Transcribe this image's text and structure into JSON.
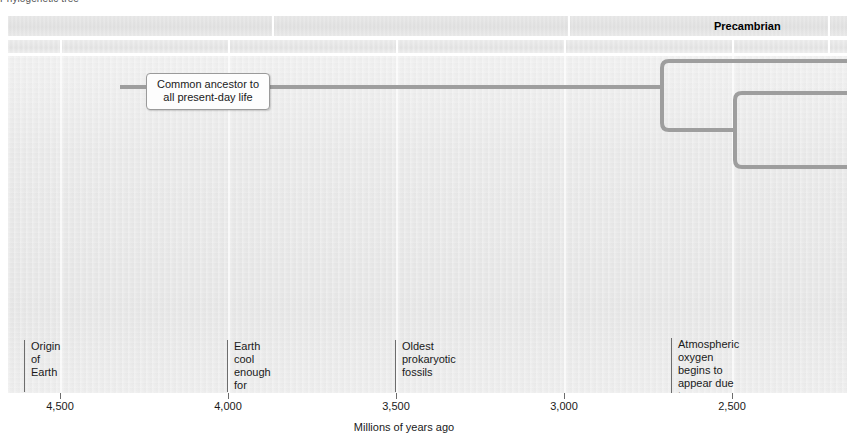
{
  "figure": {
    "caption": "Phylogenetic tree"
  },
  "colors": {
    "tree_line": "#9e9e9e",
    "band_fill": "#e0e0e0",
    "plot_bg": "#e9e9e9",
    "rule": "#6d6d6d",
    "text": "#1a1a1a"
  },
  "era_band": {
    "label": "Precambrian",
    "label_x": 706,
    "separators": [
      264,
      560,
      820
    ]
  },
  "period_band": {
    "separators": [
      52,
      220,
      388,
      556,
      724,
      820
    ]
  },
  "plot": {
    "column_separators": [
      52,
      220,
      388,
      556,
      724
    ]
  },
  "callout": {
    "line1": "Common ancestor to",
    "line2": "all present-day life"
  },
  "tree": {
    "trunk": {
      "x1": 112,
      "x2": 654,
      "y": 31
    },
    "node1": {
      "x": 654,
      "y_in": 31,
      "y_top": 5,
      "y_bottom": 74,
      "x_end": 839
    },
    "node2": {
      "x": 727,
      "y_in": 74,
      "y_top": 37,
      "y_bottom": 111,
      "x_end": 839
    }
  },
  "events": [
    {
      "name": "origin-of-earth",
      "x": 16,
      "y": 284,
      "rule_height": 52,
      "text": "Origin of\nEarth"
    },
    {
      "name": "crust-solidify",
      "x": 219,
      "y": 284,
      "rule_height": 52,
      "text": "Earth cool enough for\ncrust to solidify"
    },
    {
      "name": "oldest-prokaryotic-fossils",
      "x": 387,
      "y": 284,
      "rule_height": 52,
      "text": "Oldest prokaryotic fossils"
    },
    {
      "name": "atmospheric-oxygen",
      "x": 663,
      "y": 282,
      "rule_height": 56,
      "text": "Atmospheric oxygen\nbegins to appear due\nto photosynthetic\nprokaryotes"
    }
  ],
  "axis": {
    "title": "Millions of years ago",
    "ticks": [
      {
        "x": 52,
        "label": "4,500"
      },
      {
        "x": 220,
        "label": "4,000"
      },
      {
        "x": 388,
        "label": "3,500"
      },
      {
        "x": 556,
        "label": "3,000"
      },
      {
        "x": 724,
        "label": "2,500"
      }
    ]
  }
}
